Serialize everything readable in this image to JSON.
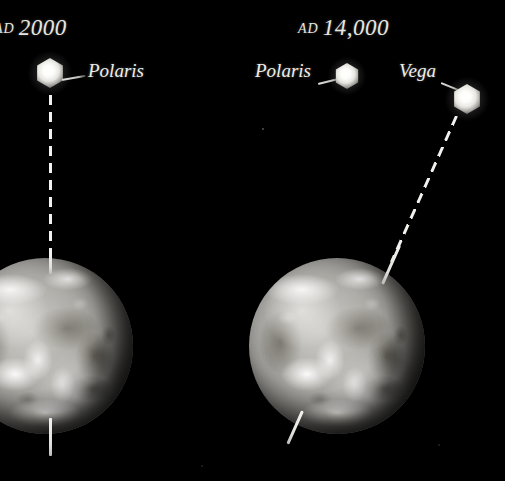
{
  "figure": {
    "background_color": "#000000",
    "star_color": "#ffffff",
    "axis_color": "#f2f1ed",
    "text_color": "#e8e6e0",
    "width": 505,
    "height": 481
  },
  "panels": [
    {
      "id": "panel-ad-2000",
      "epoch_prefix": "AD",
      "epoch_year": "2000",
      "epoch_full": "AD 2000",
      "axis_tilt_degrees": 0,
      "stars": [
        {
          "name": "Polaris",
          "label": "Polaris",
          "role": "pole-star"
        }
      ]
    },
    {
      "id": "panel-ad-14000",
      "epoch_prefix": "AD",
      "epoch_year": "14,000",
      "epoch_full": "AD 14,000",
      "axis_tilt_degrees": 24,
      "stars": [
        {
          "name": "Polaris",
          "label": "Polaris",
          "role": "former-pole-star"
        },
        {
          "name": "Vega",
          "label": "Vega",
          "role": "pole-star"
        }
      ]
    }
  ],
  "labels": {
    "epoch_left": "AD 2000",
    "epoch_left_prefix": "AD",
    "epoch_left_year": "2000",
    "epoch_right": "AD 14,000",
    "epoch_right_prefix": "AD",
    "epoch_right_year": "14,000",
    "polaris_left": "Polaris",
    "polaris_right": "Polaris",
    "vega_right": "Vega"
  }
}
